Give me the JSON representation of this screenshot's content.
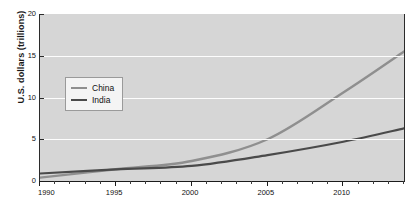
{
  "chart_data": {
    "type": "line",
    "title": "",
    "title_clipped": true,
    "xlabel": "",
    "ylabel": "U.S. dollars (trillions)",
    "xlim": [
      1990,
      2014
    ],
    "ylim": [
      0,
      20
    ],
    "yticks": [
      0,
      5,
      10,
      15,
      20
    ],
    "ytick_labels": [
      "0",
      "5",
      "10",
      "15",
      "20"
    ],
    "xticks": [
      1990,
      1995,
      2000,
      2005,
      2010
    ],
    "xtick_labels": [
      "1990",
      "1995",
      "2000",
      "2005",
      "2010"
    ],
    "x_minor_tick_interval": 1,
    "grid": "horizontal",
    "legend_position": "upper-left-inside",
    "plot_background": "#d6d6d6",
    "gridline_color": "#fdfdfd",
    "x": [
      1990,
      1991,
      1992,
      1993,
      1994,
      1995,
      1996,
      1997,
      1998,
      1999,
      2000,
      2001,
      2002,
      2003,
      2004,
      2005,
      2006,
      2007,
      2008,
      2009,
      2010,
      2011,
      2012,
      2013,
      2014
    ],
    "series": [
      {
        "name": "China",
        "color": "#8f8f8f",
        "values": [
          0.4,
          0.43,
          0.49,
          0.62,
          0.57,
          0.74,
          0.86,
          0.96,
          1.03,
          1.09,
          1.21,
          1.34,
          1.47,
          1.66,
          1.96,
          2.29,
          2.75,
          3.55,
          4.6,
          5.11,
          6.09,
          7.55,
          8.53,
          9.57,
          10.48
        ]
      },
      {
        "name": "India",
        "color": "#4a4a4a",
        "values": [
          0.32,
          0.27,
          0.29,
          0.28,
          0.33,
          0.37,
          0.4,
          0.42,
          0.43,
          0.46,
          0.47,
          0.49,
          0.52,
          0.62,
          0.72,
          0.83,
          0.95,
          1.24,
          1.22,
          1.37,
          1.71,
          1.82,
          1.83,
          1.86,
          2.04
        ]
      }
    ],
    "plot_values": {
      "note": "values as drawn on the plotted curves, in trillions of U.S. dollars",
      "China": [
        {
          "year": 1990,
          "value": 0.4
        },
        {
          "year": 1995,
          "value": 1.4
        },
        {
          "year": 2000,
          "value": 2.4
        },
        {
          "year": 2005,
          "value": 5.0
        },
        {
          "year": 2010,
          "value": 10.6
        },
        {
          "year": 2014,
          "value": 15.5
        }
      ],
      "India": [
        {
          "year": 1990,
          "value": 0.9
        },
        {
          "year": 1995,
          "value": 1.4
        },
        {
          "year": 2000,
          "value": 1.8
        },
        {
          "year": 2005,
          "value": 3.1
        },
        {
          "year": 2010,
          "value": 4.7
        },
        {
          "year": 2014,
          "value": 6.3
        }
      ]
    }
  },
  "legend": {
    "items": [
      {
        "label": "China",
        "color": "#8f8f8f"
      },
      {
        "label": "India",
        "color": "#4a4a4a"
      }
    ]
  },
  "axes": {
    "y_title": "U.S. dollars (trillions)"
  }
}
